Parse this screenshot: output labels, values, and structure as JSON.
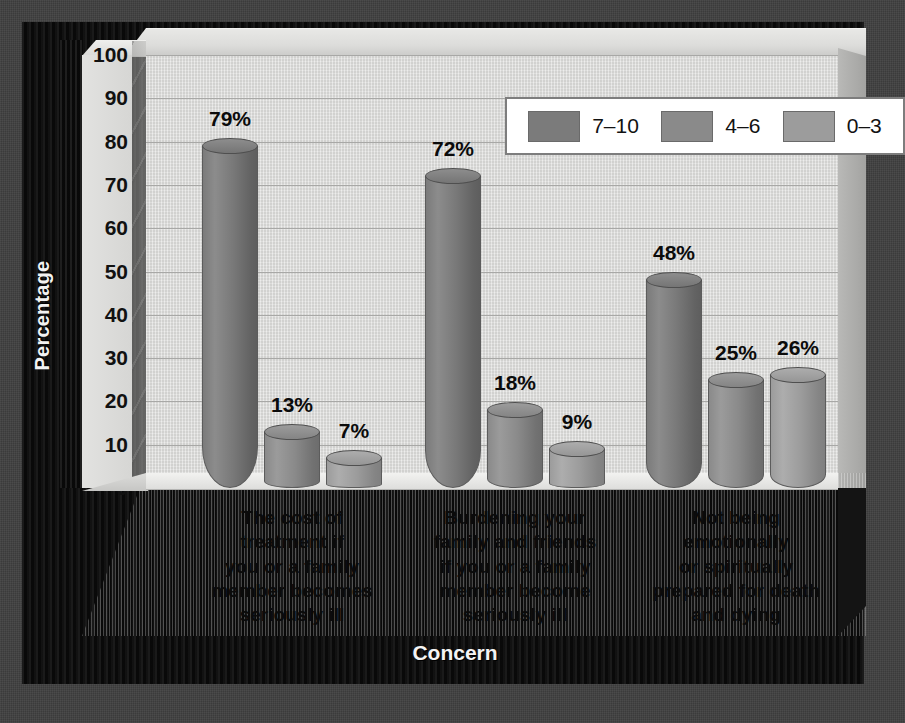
{
  "chart_data": {
    "type": "bar",
    "title": "",
    "xlabel": "Concern",
    "ylabel": "Percentage",
    "ylim": [
      0,
      100
    ],
    "yticks": [
      100,
      90,
      80,
      70,
      60,
      50,
      40,
      30,
      20,
      10,
      0
    ],
    "grid": true,
    "legend_position": "top-right",
    "categories": [
      "The cost of treatment if you or a family member becomes seriously ill",
      "Burdening your family and friends if you or a family member become seriously ill",
      "Not being emotionally or spiritually prepared for death and dying"
    ],
    "category_lines": [
      [
        "The cost of",
        "treatment if",
        "you or a family",
        "member becomes",
        "seriously ill"
      ],
      [
        "Burdening your",
        "family and friends",
        "if you or a family",
        "member become",
        "seriously ill"
      ],
      [
        "Not being",
        "emotionally",
        "or spiritually",
        "prepared for death",
        "and dying"
      ]
    ],
    "series": [
      {
        "name": "7–10",
        "values": [
          79,
          72,
          48
        ],
        "labels": [
          "79%",
          "72%",
          "48%"
        ],
        "color": "#7b7b7b"
      },
      {
        "name": "4–6",
        "values": [
          13,
          18,
          25
        ],
        "labels": [
          "13%",
          "18%",
          "25%"
        ],
        "color": "#8a8a8a"
      },
      {
        "name": "0–3",
        "values": [
          7,
          9,
          26
        ],
        "labels": [
          "7%",
          "9%",
          "26%"
        ],
        "color": "#9c9c9c"
      }
    ]
  },
  "axis": {
    "y_title": "Percentage",
    "x_title": "Concern",
    "y_tick_labels": [
      "100",
      "90",
      "80",
      "70",
      "60",
      "50",
      "40",
      "30",
      "20",
      "10",
      "0"
    ]
  },
  "legend": {
    "items": [
      {
        "label": "7–10"
      },
      {
        "label": "4–6"
      },
      {
        "label": "0–3"
      }
    ]
  },
  "colors": {
    "background": "#3f3f3f",
    "frame": "#0d0d0d",
    "plot_face": "#dededc",
    "floor": "#e4e4e2",
    "gridline": "#a8a8a6",
    "series_dark": "#7b7b7b",
    "series_mid": "#8a8a8a",
    "series_light": "#9c9c9c",
    "text": "#0b0b0b",
    "text_on_frame": "#f2f2f2"
  }
}
